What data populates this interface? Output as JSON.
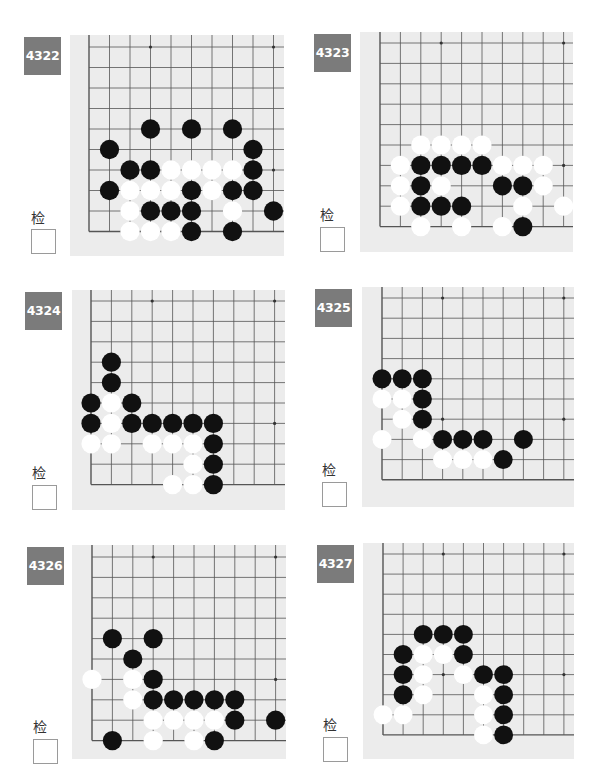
{
  "check_label": "检查",
  "colors": {
    "badge_bg": "#7b7b7b",
    "badge_text": "#ffffff",
    "board_bg": "#ececec",
    "grid_line": "#555555",
    "black_stone": "#111111",
    "white_stone": "#ffffff"
  },
  "problems": [
    {
      "id": "4322",
      "badge": {
        "x": 24,
        "y": 37
      },
      "board": {
        "x": 70,
        "y": 35,
        "w": 214,
        "h": 221,
        "ox": 19,
        "oy": 12,
        "step": 20.5
      },
      "label": {
        "x": 31,
        "y": 207
      },
      "checkbox": {
        "x": 31,
        "y": 229
      },
      "stones": [
        {
          "c": "B",
          "col": 3,
          "row": 4
        },
        {
          "c": "B",
          "col": 5,
          "row": 4
        },
        {
          "c": "B",
          "col": 7,
          "row": 4
        },
        {
          "c": "B",
          "col": 1,
          "row": 5
        },
        {
          "c": "B",
          "col": 8,
          "row": 5
        },
        {
          "c": "B",
          "col": 2,
          "row": 6
        },
        {
          "c": "B",
          "col": 3,
          "row": 6
        },
        {
          "c": "W",
          "col": 4,
          "row": 6
        },
        {
          "c": "W",
          "col": 5,
          "row": 6
        },
        {
          "c": "W",
          "col": 6,
          "row": 6
        },
        {
          "c": "W",
          "col": 7,
          "row": 6
        },
        {
          "c": "B",
          "col": 8,
          "row": 6
        },
        {
          "c": "B",
          "col": 1,
          "row": 7
        },
        {
          "c": "W",
          "col": 2,
          "row": 7
        },
        {
          "c": "W",
          "col": 3,
          "row": 7
        },
        {
          "c": "W",
          "col": 4,
          "row": 7
        },
        {
          "c": "B",
          "col": 5,
          "row": 7
        },
        {
          "c": "W",
          "col": 6,
          "row": 7
        },
        {
          "c": "B",
          "col": 7,
          "row": 7
        },
        {
          "c": "B",
          "col": 8,
          "row": 7
        },
        {
          "c": "W",
          "col": 2,
          "row": 8
        },
        {
          "c": "B",
          "col": 3,
          "row": 8
        },
        {
          "c": "B",
          "col": 4,
          "row": 8
        },
        {
          "c": "B",
          "col": 5,
          "row": 8
        },
        {
          "c": "W",
          "col": 7,
          "row": 8
        },
        {
          "c": "B",
          "col": 9,
          "row": 8
        },
        {
          "c": "W",
          "col": 2,
          "row": 9
        },
        {
          "c": "W",
          "col": 3,
          "row": 9
        },
        {
          "c": "W",
          "col": 4,
          "row": 9
        },
        {
          "c": "B",
          "col": 5,
          "row": 9
        },
        {
          "c": "B",
          "col": 7,
          "row": 9
        }
      ]
    },
    {
      "id": "4323",
      "badge": {
        "x": 314,
        "y": 34
      },
      "board": {
        "x": 360,
        "y": 32,
        "w": 213,
        "h": 220,
        "ox": 20,
        "oy": 11,
        "step": 20.4
      },
      "label": {
        "x": 320,
        "y": 204
      },
      "checkbox": {
        "x": 320,
        "y": 227
      },
      "stones": [
        {
          "c": "W",
          "col": 2,
          "row": 5
        },
        {
          "c": "W",
          "col": 3,
          "row": 5
        },
        {
          "c": "W",
          "col": 4,
          "row": 5
        },
        {
          "c": "W",
          "col": 5,
          "row": 5
        },
        {
          "c": "W",
          "col": 1,
          "row": 6
        },
        {
          "c": "B",
          "col": 2,
          "row": 6
        },
        {
          "c": "B",
          "col": 3,
          "row": 6
        },
        {
          "c": "B",
          "col": 4,
          "row": 6
        },
        {
          "c": "B",
          "col": 5,
          "row": 6
        },
        {
          "c": "W",
          "col": 6,
          "row": 6
        },
        {
          "c": "W",
          "col": 7,
          "row": 6
        },
        {
          "c": "W",
          "col": 8,
          "row": 6
        },
        {
          "c": "W",
          "col": 1,
          "row": 7
        },
        {
          "c": "B",
          "col": 2,
          "row": 7
        },
        {
          "c": "W",
          "col": 3,
          "row": 7
        },
        {
          "c": "B",
          "col": 6,
          "row": 7
        },
        {
          "c": "B",
          "col": 7,
          "row": 7
        },
        {
          "c": "W",
          "col": 8,
          "row": 7
        },
        {
          "c": "W",
          "col": 1,
          "row": 8
        },
        {
          "c": "B",
          "col": 2,
          "row": 8
        },
        {
          "c": "B",
          "col": 3,
          "row": 8
        },
        {
          "c": "B",
          "col": 4,
          "row": 8
        },
        {
          "c": "W",
          "col": 7,
          "row": 8
        },
        {
          "c": "W",
          "col": 9,
          "row": 8
        },
        {
          "c": "W",
          "col": 2,
          "row": 9
        },
        {
          "c": "W",
          "col": 4,
          "row": 9
        },
        {
          "c": "W",
          "col": 6,
          "row": 9
        },
        {
          "c": "B",
          "col": 7,
          "row": 9
        }
      ]
    },
    {
      "id": "4324",
      "badge": {
        "x": 25,
        "y": 292
      },
      "board": {
        "x": 72,
        "y": 290,
        "w": 213,
        "h": 220,
        "ox": 19,
        "oy": 11,
        "step": 20.4
      },
      "label": {
        "x": 32,
        "y": 462
      },
      "checkbox": {
        "x": 32,
        "y": 485
      },
      "stones": [
        {
          "c": "B",
          "col": 1,
          "row": 3
        },
        {
          "c": "B",
          "col": 1,
          "row": 4
        },
        {
          "c": "B",
          "col": 0,
          "row": 5
        },
        {
          "c": "W",
          "col": 1,
          "row": 5
        },
        {
          "c": "B",
          "col": 2,
          "row": 5
        },
        {
          "c": "B",
          "col": 0,
          "row": 6
        },
        {
          "c": "W",
          "col": 1,
          "row": 6
        },
        {
          "c": "B",
          "col": 2,
          "row": 6
        },
        {
          "c": "B",
          "col": 3,
          "row": 6
        },
        {
          "c": "B",
          "col": 4,
          "row": 6
        },
        {
          "c": "B",
          "col": 5,
          "row": 6
        },
        {
          "c": "B",
          "col": 6,
          "row": 6
        },
        {
          "c": "W",
          "col": 0,
          "row": 7
        },
        {
          "c": "W",
          "col": 1,
          "row": 7
        },
        {
          "c": "W",
          "col": 3,
          "row": 7
        },
        {
          "c": "W",
          "col": 4,
          "row": 7
        },
        {
          "c": "W",
          "col": 5,
          "row": 7
        },
        {
          "c": "B",
          "col": 6,
          "row": 7
        },
        {
          "c": "W",
          "col": 5,
          "row": 8
        },
        {
          "c": "B",
          "col": 6,
          "row": 8
        },
        {
          "c": "W",
          "col": 4,
          "row": 9
        },
        {
          "c": "W",
          "col": 5,
          "row": 9
        },
        {
          "c": "B",
          "col": 6,
          "row": 9
        }
      ]
    },
    {
      "id": "4325",
      "badge": {
        "x": 315,
        "y": 289
      },
      "board": {
        "x": 362,
        "y": 287,
        "w": 212,
        "h": 220,
        "ox": 20,
        "oy": 11,
        "step": 20.2
      },
      "label": {
        "x": 322,
        "y": 459
      },
      "checkbox": {
        "x": 322,
        "y": 482
      },
      "stones": [
        {
          "c": "B",
          "col": 0,
          "row": 4
        },
        {
          "c": "B",
          "col": 1,
          "row": 4
        },
        {
          "c": "B",
          "col": 2,
          "row": 4
        },
        {
          "c": "W",
          "col": 0,
          "row": 5
        },
        {
          "c": "W",
          "col": 1,
          "row": 5
        },
        {
          "c": "B",
          "col": 2,
          "row": 5
        },
        {
          "c": "W",
          "col": 1,
          "row": 6
        },
        {
          "c": "B",
          "col": 2,
          "row": 6
        },
        {
          "c": "W",
          "col": 0,
          "row": 7
        },
        {
          "c": "W",
          "col": 2,
          "row": 7
        },
        {
          "c": "B",
          "col": 3,
          "row": 7
        },
        {
          "c": "B",
          "col": 4,
          "row": 7
        },
        {
          "c": "B",
          "col": 5,
          "row": 7
        },
        {
          "c": "B",
          "col": 7,
          "row": 7
        },
        {
          "c": "W",
          "col": 3,
          "row": 8
        },
        {
          "c": "W",
          "col": 4,
          "row": 8
        },
        {
          "c": "W",
          "col": 5,
          "row": 8
        },
        {
          "c": "B",
          "col": 6,
          "row": 8
        }
      ]
    },
    {
      "id": "4326",
      "badge": {
        "x": 27,
        "y": 547
      },
      "board": {
        "x": 72,
        "y": 545,
        "w": 214,
        "h": 214,
        "ox": 20,
        "oy": 12,
        "step": 20.4
      },
      "label": {
        "x": 33,
        "y": 716
      },
      "checkbox": {
        "x": 33,
        "y": 739
      },
      "stones": [
        {
          "c": "B",
          "col": 1,
          "row": 4
        },
        {
          "c": "B",
          "col": 3,
          "row": 4
        },
        {
          "c": "B",
          "col": 2,
          "row": 5
        },
        {
          "c": "W",
          "col": 0,
          "row": 6
        },
        {
          "c": "W",
          "col": 2,
          "row": 6
        },
        {
          "c": "B",
          "col": 3,
          "row": 6
        },
        {
          "c": "W",
          "col": 2,
          "row": 7
        },
        {
          "c": "B",
          "col": 3,
          "row": 7
        },
        {
          "c": "B",
          "col": 4,
          "row": 7
        },
        {
          "c": "B",
          "col": 5,
          "row": 7
        },
        {
          "c": "B",
          "col": 6,
          "row": 7
        },
        {
          "c": "B",
          "col": 7,
          "row": 7
        },
        {
          "c": "W",
          "col": 3,
          "row": 8
        },
        {
          "c": "W",
          "col": 4,
          "row": 8
        },
        {
          "c": "W",
          "col": 5,
          "row": 8
        },
        {
          "c": "W",
          "col": 6,
          "row": 8
        },
        {
          "c": "B",
          "col": 7,
          "row": 8
        },
        {
          "c": "B",
          "col": 9,
          "row": 8
        },
        {
          "c": "B",
          "col": 1,
          "row": 9
        },
        {
          "c": "W",
          "col": 3,
          "row": 9
        },
        {
          "c": "W",
          "col": 5,
          "row": 9
        },
        {
          "c": "B",
          "col": 6,
          "row": 9
        }
      ]
    },
    {
      "id": "4327",
      "badge": {
        "x": 317,
        "y": 545
      },
      "board": {
        "x": 363,
        "y": 543,
        "w": 211,
        "h": 216,
        "ox": 20,
        "oy": 11,
        "step": 20.1
      },
      "label": {
        "x": 323,
        "y": 714
      },
      "checkbox": {
        "x": 323,
        "y": 737
      },
      "stones": [
        {
          "c": "B",
          "col": 2,
          "row": 4
        },
        {
          "c": "B",
          "col": 3,
          "row": 4
        },
        {
          "c": "B",
          "col": 4,
          "row": 4
        },
        {
          "c": "B",
          "col": 1,
          "row": 5
        },
        {
          "c": "W",
          "col": 2,
          "row": 5
        },
        {
          "c": "W",
          "col": 3,
          "row": 5
        },
        {
          "c": "B",
          "col": 4,
          "row": 5
        },
        {
          "c": "B",
          "col": 1,
          "row": 6
        },
        {
          "c": "W",
          "col": 2,
          "row": 6
        },
        {
          "c": "W",
          "col": 4,
          "row": 6
        },
        {
          "c": "B",
          "col": 5,
          "row": 6
        },
        {
          "c": "B",
          "col": 6,
          "row": 6
        },
        {
          "c": "B",
          "col": 1,
          "row": 7
        },
        {
          "c": "W",
          "col": 2,
          "row": 7
        },
        {
          "c": "W",
          "col": 5,
          "row": 7
        },
        {
          "c": "B",
          "col": 6,
          "row": 7
        },
        {
          "c": "W",
          "col": 0,
          "row": 8
        },
        {
          "c": "W",
          "col": 1,
          "row": 8
        },
        {
          "c": "W",
          "col": 5,
          "row": 8
        },
        {
          "c": "B",
          "col": 6,
          "row": 8
        },
        {
          "c": "W",
          "col": 5,
          "row": 9
        },
        {
          "c": "B",
          "col": 6,
          "row": 9
        }
      ]
    }
  ]
}
